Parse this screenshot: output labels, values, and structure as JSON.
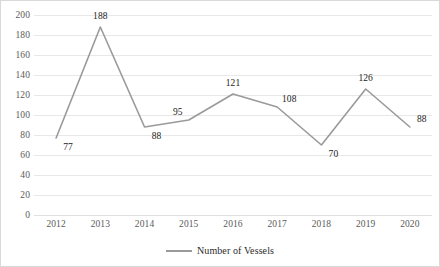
{
  "figure": {
    "width": 440,
    "height": 267,
    "background": "#ffffff",
    "border_color": "#d9d9d9"
  },
  "legend": {
    "position": "bottom-center",
    "entries": [
      {
        "label": "Number of Vessels",
        "color": "#9a9a9a",
        "marker": "line-swatch"
      }
    ]
  },
  "axes": {
    "y": {
      "ticks": [
        "0",
        "20",
        "40",
        "60",
        "80",
        "100",
        "120",
        "140",
        "160",
        "180",
        "200"
      ],
      "min": 0,
      "max": 200,
      "step": 20,
      "label": "",
      "grid": true,
      "tick_color": "#5a5a5a"
    },
    "x": {
      "ticks": [
        "2012",
        "2013",
        "2014",
        "2015",
        "2016",
        "2017",
        "2018",
        "2019",
        "2020"
      ],
      "label": "",
      "grid": false,
      "tick_color": "#5a5a5a"
    }
  },
  "chart_data": {
    "type": "line",
    "title": "",
    "subtitle": "",
    "xlabel": "",
    "ylabel": "",
    "ylim": [
      0,
      200
    ],
    "ytick_step": 20,
    "grid": true,
    "legend_position": "bottom-center",
    "categories": [
      "2012",
      "2013",
      "2014",
      "2015",
      "2016",
      "2017",
      "2018",
      "2019",
      "2020"
    ],
    "series": [
      {
        "name": "Number of Vessels",
        "color": "#9a9a9a",
        "values": [
          77,
          188,
          88,
          95,
          121,
          108,
          70,
          126,
          88
        ],
        "data_labels": [
          "77",
          "188",
          "88",
          "95",
          "121",
          "108",
          "70",
          "126",
          "88"
        ],
        "data_label_placement": [
          "below-right",
          "above",
          "below-right",
          "above-left",
          "above",
          "above-right",
          "below-right",
          "above",
          "above-right"
        ]
      }
    ]
  }
}
